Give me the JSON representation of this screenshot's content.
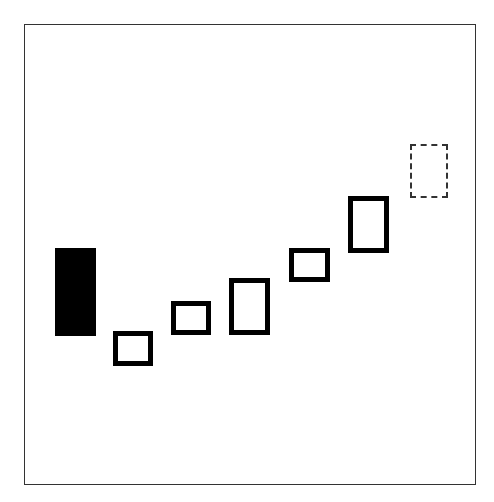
{
  "diagram": {
    "type": "candlestick-pattern",
    "frame": {
      "border_color": "#333333",
      "background": "#ffffff"
    },
    "candles": [
      {
        "id": 1,
        "style": "filled",
        "color": "#000000",
        "left": 55,
        "top": 248,
        "width": 41,
        "height": 88
      },
      {
        "id": 2,
        "style": "hollow",
        "color": "#000000",
        "left": 113,
        "top": 331,
        "width": 40,
        "height": 35
      },
      {
        "id": 3,
        "style": "hollow",
        "color": "#000000",
        "left": 171,
        "top": 301,
        "width": 40,
        "height": 34
      },
      {
        "id": 4,
        "style": "hollow",
        "color": "#000000",
        "left": 229,
        "top": 278,
        "width": 41,
        "height": 57
      },
      {
        "id": 5,
        "style": "hollow",
        "color": "#000000",
        "left": 289,
        "top": 248,
        "width": 41,
        "height": 34
      },
      {
        "id": 6,
        "style": "hollow",
        "color": "#000000",
        "left": 348,
        "top": 196,
        "width": 41,
        "height": 57
      },
      {
        "id": 7,
        "style": "projected",
        "color": "#333333",
        "left": 410,
        "top": 144,
        "width": 38,
        "height": 54
      }
    ]
  }
}
